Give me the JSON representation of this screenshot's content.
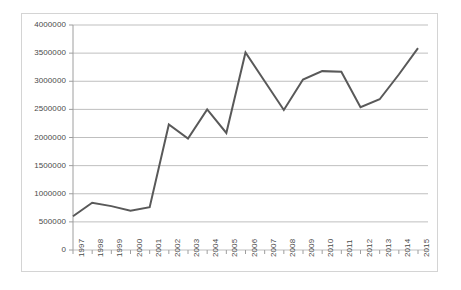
{
  "chart_data": {
    "type": "line",
    "title": "",
    "subtitle": "",
    "xlabel": "",
    "ylabel": "",
    "legend": [],
    "legend_position": "none",
    "grid": "horizontal",
    "ylim": [
      0,
      4000000
    ],
    "ytick_labels": [
      "4000000",
      "3500000",
      "3000000",
      "2500000",
      "2000000",
      "1500000",
      "1000000",
      "500000",
      "0"
    ],
    "ytick_values": [
      4000000,
      3500000,
      3000000,
      2500000,
      2000000,
      1500000,
      1000000,
      500000,
      0
    ],
    "categories": [
      "1997",
      "1998",
      "1999",
      "2000",
      "2001",
      "2002",
      "2003",
      "2004",
      "2005",
      "2006",
      "2007",
      "2008",
      "2009",
      "2010",
      "2011",
      "2012",
      "2013",
      "2014",
      "2015"
    ],
    "values": [
      600000,
      840000,
      780000,
      700000,
      760000,
      2230000,
      1980000,
      2500000,
      2080000,
      3510000,
      3000000,
      2490000,
      3030000,
      3180000,
      3170000,
      2540000,
      2680000,
      3120000,
      3590000
    ],
    "series": [
      {
        "name": "series-1",
        "color": "#595959",
        "values": [
          600000,
          840000,
          780000,
          700000,
          760000,
          2230000,
          1980000,
          2500000,
          2080000,
          3510000,
          3000000,
          2490000,
          3030000,
          3180000,
          3170000,
          2540000,
          2680000,
          3120000,
          3590000
        ]
      }
    ],
    "colors": {
      "line": "#595959",
      "grid": "#bfbfbf",
      "axis": "#9e9e9e",
      "frame": "#d4d4d4",
      "text": "#4a4a4a",
      "background": "#ffffff"
    }
  }
}
